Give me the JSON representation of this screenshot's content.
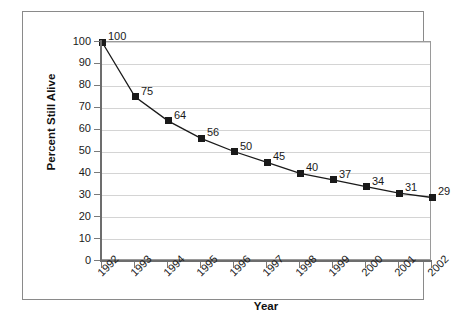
{
  "chart_data": {
    "type": "line",
    "title": "",
    "xlabel": "Year",
    "ylabel": "Percent Still Alive",
    "categories": [
      "1992",
      "1993",
      "1994",
      "1995",
      "1996",
      "1997",
      "1998",
      "1999",
      "2000",
      "2001",
      "2002"
    ],
    "values": [
      100,
      75,
      64,
      56,
      50,
      45,
      40,
      37,
      34,
      31,
      29
    ],
    "point_labels": [
      "100",
      "75",
      "64",
      "56",
      "50",
      "45",
      "40",
      "37",
      "34",
      "31",
      "29"
    ],
    "ylim": [
      0,
      100
    ],
    "y_ticks": [
      0,
      10,
      20,
      30,
      40,
      50,
      60,
      70,
      80,
      90,
      100
    ],
    "y_tick_labels": [
      "0",
      "10",
      "20",
      "30",
      "40",
      "50",
      "60",
      "70",
      "80",
      "90",
      "100"
    ],
    "grid": "horizontal",
    "legend": "none",
    "marker": "square",
    "series_color": "#1a1a1a",
    "gridline_color": "#d4d4d4",
    "axis_color": "#6d6d6d",
    "plot_border_color": "#9a9a9a",
    "frame_border_color": "#8a8a8a",
    "background_color": "#ffffff"
  }
}
